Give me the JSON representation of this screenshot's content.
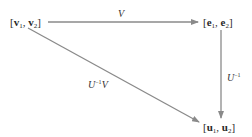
{
  "diagram": {
    "type": "commutative-diagram",
    "colors": {
      "arrow": "#8a8a8a",
      "text": "#2a2a2a"
    },
    "nodes": [
      {
        "id": "v",
        "open": "[",
        "a": "v",
        "a_sub": "1",
        "sep": ", ",
        "b": "v",
        "b_sub": "2",
        "close": "]"
      },
      {
        "id": "e",
        "open": "[",
        "a": "e",
        "a_sub": "1",
        "sep": ", ",
        "b": "e",
        "b_sub": "2",
        "close": "]"
      },
      {
        "id": "u",
        "open": "[",
        "a": "u",
        "a_sub": "1",
        "sep": ", ",
        "b": "u",
        "b_sub": "2",
        "close": "]"
      }
    ],
    "edges": [
      {
        "from": "v",
        "to": "e",
        "label": "V",
        "label_sup": ""
      },
      {
        "from": "e",
        "to": "u",
        "label": "U",
        "label_sup": "−1"
      },
      {
        "from": "v",
        "to": "u",
        "label": "U",
        "label_sup": "−1",
        "label_suffix": "V"
      }
    ]
  }
}
